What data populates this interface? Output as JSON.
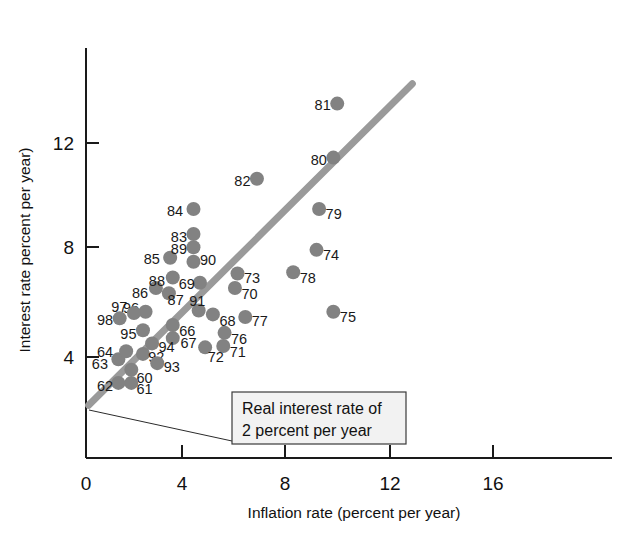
{
  "chart_data": {
    "type": "scatter",
    "title": "",
    "xlabel": "Inflation rate (percent per year)",
    "ylabel": "Interest rate percent per year)",
    "xlim": [
      0,
      18
    ],
    "ylim": [
      0,
      15
    ],
    "xticks": [
      "0",
      "4",
      "8",
      "12",
      "16"
    ],
    "xtick_values": [
      0,
      4,
      8,
      12,
      16
    ],
    "yticks": [
      "4",
      "8",
      "12"
    ],
    "ytick_values": [
      4,
      8,
      12
    ],
    "grid": false,
    "legend": "none",
    "marker_color": "#828282",
    "trend_color": "#9a9a9a",
    "annotations": [
      {
        "name": "real-interest-rate-callout",
        "line1": "Real interest rate of",
        "line2": "2 percent per year"
      }
    ],
    "series": [
      {
        "name": "Year observations",
        "point_label_position": "varies",
        "points": [
          {
            "label": "60",
            "x": 1.75,
            "y": 3.35,
            "lx": 1.95,
            "ly": 3.05,
            "anchor": "start"
          },
          {
            "label": "61",
            "x": 1.75,
            "y": 2.85,
            "lx": 1.95,
            "ly": 2.62,
            "anchor": "start"
          },
          {
            "label": "62",
            "x": 1.25,
            "y": 2.85,
            "lx": 1.05,
            "ly": 2.72,
            "anchor": "end"
          },
          {
            "label": "63",
            "x": 1.25,
            "y": 3.75,
            "lx": 0.85,
            "ly": 3.55,
            "anchor": "end"
          },
          {
            "label": "64",
            "x": 1.55,
            "y": 4.05,
            "lx": 1.05,
            "ly": 4.02,
            "anchor": "end"
          },
          {
            "label": "66",
            "x": 3.35,
            "y": 5.05,
            "lx": 3.6,
            "ly": 4.82,
            "anchor": "start"
          },
          {
            "label": "67",
            "x": 3.35,
            "y": 4.55,
            "lx": 3.65,
            "ly": 4.38,
            "anchor": "start"
          },
          {
            "label": "68",
            "x": 4.9,
            "y": 5.45,
            "lx": 5.15,
            "ly": 5.2,
            "anchor": "start"
          },
          {
            "label": "69",
            "x": 4.4,
            "y": 6.65,
            "lx": 4.2,
            "ly": 6.62,
            "anchor": "end"
          },
          {
            "label": "70",
            "x": 5.75,
            "y": 6.45,
            "lx": 6.0,
            "ly": 6.22,
            "anchor": "start"
          },
          {
            "label": "71",
            "x": 5.3,
            "y": 4.25,
            "lx": 5.55,
            "ly": 4.02,
            "anchor": "start"
          },
          {
            "label": "72",
            "x": 4.6,
            "y": 4.2,
            "lx": 4.7,
            "ly": 3.85,
            "anchor": "start"
          },
          {
            "label": "73",
            "x": 5.85,
            "y": 7.0,
            "lx": 6.1,
            "ly": 6.82,
            "anchor": "start"
          },
          {
            "label": "74",
            "x": 8.9,
            "y": 7.9,
            "lx": 9.15,
            "ly": 7.7,
            "anchor": "start"
          },
          {
            "label": "75",
            "x": 9.55,
            "y": 5.55,
            "lx": 9.8,
            "ly": 5.35,
            "anchor": "start"
          },
          {
            "label": "76",
            "x": 5.35,
            "y": 4.75,
            "lx": 5.6,
            "ly": 4.52,
            "anchor": "start"
          },
          {
            "label": "77",
            "x": 6.15,
            "y": 5.35,
            "lx": 6.4,
            "ly": 5.2,
            "anchor": "start"
          },
          {
            "label": "78",
            "x": 8.0,
            "y": 7.05,
            "lx": 8.25,
            "ly": 6.85,
            "anchor": "start"
          },
          {
            "label": "79",
            "x": 9.0,
            "y": 9.45,
            "lx": 9.25,
            "ly": 9.25,
            "anchor": "start"
          },
          {
            "label": "80",
            "x": 9.55,
            "y": 11.4,
            "lx": 9.3,
            "ly": 11.3,
            "anchor": "end"
          },
          {
            "label": "81",
            "x": 9.7,
            "y": 13.45,
            "lx": 9.45,
            "ly": 13.38,
            "anchor": "end"
          },
          {
            "label": "82",
            "x": 6.6,
            "y": 10.6,
            "lx": 6.35,
            "ly": 10.5,
            "anchor": "end"
          },
          {
            "label": "83",
            "x": 4.15,
            "y": 8.5,
            "lx": 3.9,
            "ly": 8.4,
            "anchor": "end"
          },
          {
            "label": "84",
            "x": 4.15,
            "y": 9.45,
            "lx": 3.75,
            "ly": 9.38,
            "anchor": "end"
          },
          {
            "label": "85",
            "x": 3.25,
            "y": 7.6,
            "lx": 2.85,
            "ly": 7.55,
            "anchor": "end"
          },
          {
            "label": "86",
            "x": 2.7,
            "y": 6.45,
            "lx": 2.4,
            "ly": 6.28,
            "anchor": "end"
          },
          {
            "label": "87",
            "x": 3.2,
            "y": 6.25,
            "lx": 3.15,
            "ly": 6.0,
            "anchor": "start"
          },
          {
            "label": "88",
            "x": 3.35,
            "y": 6.85,
            "lx": 3.05,
            "ly": 6.72,
            "anchor": "end"
          },
          {
            "label": "89",
            "x": 4.15,
            "y": 8.0,
            "lx": 3.9,
            "ly": 7.92,
            "anchor": "end"
          },
          {
            "label": "90",
            "x": 4.15,
            "y": 7.45,
            "lx": 4.4,
            "ly": 7.52,
            "anchor": "start"
          },
          {
            "label": "91",
            "x": 4.35,
            "y": 5.6,
            "lx": 4.3,
            "ly": 5.95,
            "anchor": "middle"
          },
          {
            "label": "92",
            "x": 2.2,
            "y": 3.95,
            "lx": 2.4,
            "ly": 3.82,
            "anchor": "start"
          },
          {
            "label": "93",
            "x": 2.75,
            "y": 3.6,
            "lx": 3.0,
            "ly": 3.45,
            "anchor": "start"
          },
          {
            "label": "94",
            "x": 2.55,
            "y": 4.35,
            "lx": 2.8,
            "ly": 4.22,
            "anchor": "start"
          },
          {
            "label": "95",
            "x": 2.2,
            "y": 4.85,
            "lx": 1.95,
            "ly": 4.72,
            "anchor": "end"
          },
          {
            "label": "96",
            "x": 2.3,
            "y": 5.55,
            "lx": 2.05,
            "ly": 5.7,
            "anchor": "end"
          },
          {
            "label": "97",
            "x": 1.85,
            "y": 5.5,
            "lx": 1.6,
            "ly": 5.72,
            "anchor": "end"
          },
          {
            "label": "98",
            "x": 1.3,
            "y": 5.3,
            "lx": 1.05,
            "ly": 5.22,
            "anchor": "end"
          }
        ]
      }
    ],
    "trend": {
      "name": "Real interest rate of 2 percent per year",
      "x_start": 0.1,
      "y_start": 2.0,
      "x_end": 12.6,
      "y_end": 14.2
    }
  }
}
